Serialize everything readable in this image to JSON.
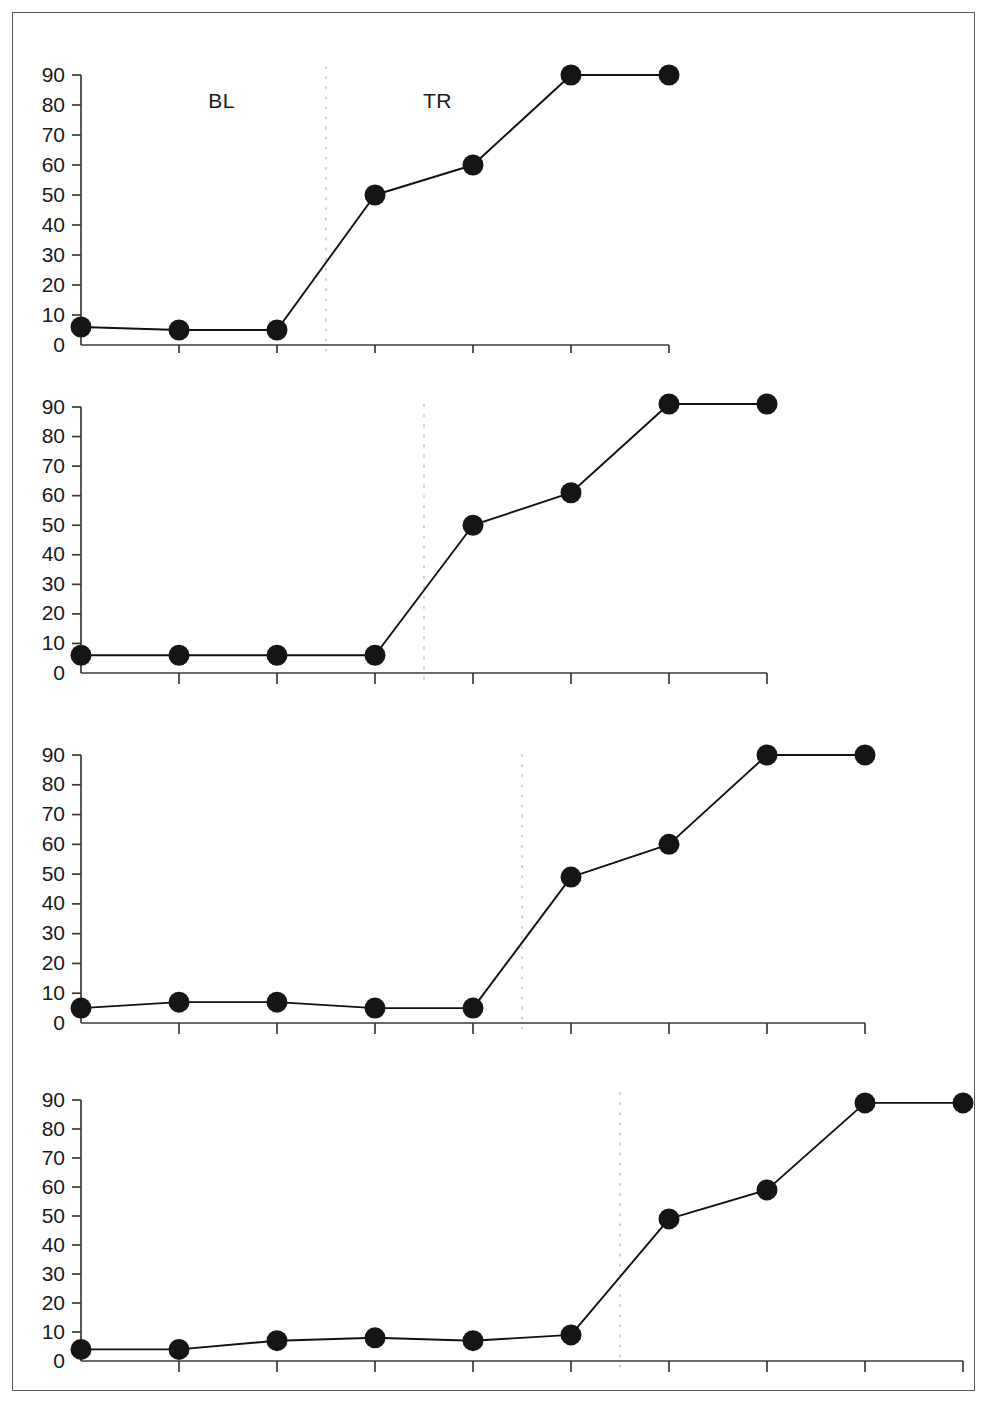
{
  "figure": {
    "border_color": "#555a5e",
    "background": "#ffffff",
    "point_color": "#151515",
    "line_color": "#111111",
    "divider_color": "#b9bcc0"
  },
  "chart_data": {
    "type": "line",
    "title": "",
    "subtitle": "",
    "xlabel": "",
    "ylabel": "",
    "ylim": [
      0,
      95
    ],
    "yticks": [
      0,
      10,
      20,
      30,
      40,
      50,
      60,
      70,
      80,
      90
    ],
    "ytick_labels": [
      "0",
      "10",
      "20",
      "30",
      "40",
      "50",
      "60",
      "70",
      "80",
      "90"
    ],
    "grid": false,
    "legend_position": "none",
    "phase_labels": {
      "baseline": "BL",
      "treatment": "TR"
    },
    "panels": [
      {
        "name": "panel-1",
        "n_sessions": 7,
        "baseline_sessions": 3,
        "treatment_sessions": 4,
        "phase_change_after_session": 3,
        "x": [
          1,
          2,
          3,
          4,
          5,
          6,
          7
        ],
        "values": [
          6,
          5,
          5,
          50,
          60,
          90,
          90
        ],
        "shows_phase_labels": true
      },
      {
        "name": "panel-2",
        "n_sessions": 8,
        "baseline_sessions": 4,
        "treatment_sessions": 4,
        "phase_change_after_session": 4,
        "x": [
          1,
          2,
          3,
          4,
          5,
          6,
          7,
          8
        ],
        "values": [
          6,
          6,
          6,
          6,
          50,
          61,
          91,
          91
        ],
        "shows_phase_labels": false
      },
      {
        "name": "panel-3",
        "n_sessions": 9,
        "baseline_sessions": 5,
        "treatment_sessions": 4,
        "phase_change_after_session": 5,
        "x": [
          1,
          2,
          3,
          4,
          5,
          6,
          7,
          8,
          9
        ],
        "values": [
          5,
          7,
          7,
          5,
          5,
          49,
          60,
          90,
          90
        ],
        "shows_phase_labels": false
      },
      {
        "name": "panel-4",
        "n_sessions": 10,
        "baseline_sessions": 6,
        "treatment_sessions": 4,
        "phase_change_after_session": 6,
        "x": [
          1,
          2,
          3,
          4,
          5,
          6,
          7,
          8,
          9,
          10
        ],
        "values": [
          4,
          4,
          7,
          8,
          7,
          9,
          49,
          59,
          89,
          89
        ],
        "shows_phase_labels": false
      }
    ]
  }
}
